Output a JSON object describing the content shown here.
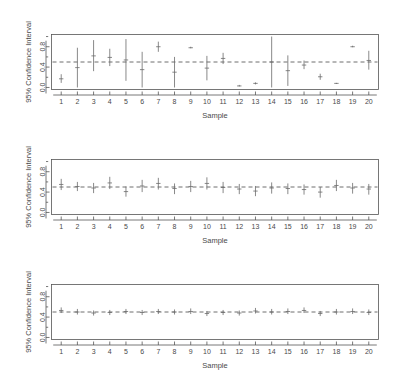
{
  "figure": {
    "background": "#ffffff",
    "foreground": "#4a4a4a",
    "interval_color": "#6b6b6b"
  },
  "chart_data": [
    {
      "type": "line",
      "panel_index": 1,
      "title": "",
      "xlabel": "Sample",
      "ylabel": "95% Confidence Interval",
      "xlim": [
        0.4,
        20.6
      ],
      "ylim": [
        -0.04,
        1.04
      ],
      "yticks": [
        0.0,
        0.4,
        0.8
      ],
      "ytick_labels": [
        "0.0",
        "0.4",
        "0.8"
      ],
      "xticks": [
        1,
        2,
        3,
        4,
        5,
        6,
        7,
        8,
        9,
        10,
        11,
        12,
        13,
        14,
        15,
        16,
        17,
        18,
        19,
        20
      ],
      "xtick_labels": [
        "1",
        "2",
        "3",
        "4",
        "5",
        "6",
        "7",
        "8",
        "9",
        "10",
        "11",
        "12",
        "13",
        "14",
        "15",
        "16",
        "17",
        "18",
        "19",
        "20"
      ],
      "grid": false,
      "reference_line": {
        "y": 0.5,
        "style": "dashed",
        "label": "true proportion"
      },
      "series": [
        {
          "name": "95% confidence intervals (small n)",
          "x": [
            1,
            2,
            3,
            4,
            5,
            6,
            7,
            8,
            9,
            10,
            11,
            12,
            13,
            14,
            15,
            16,
            17,
            18,
            19,
            20
          ],
          "lower": [
            0.09,
            0.0,
            0.32,
            0.42,
            0.13,
            0.0,
            0.7,
            0.0,
            0.77,
            0.14,
            0.46,
            0.02,
            0.06,
            0.0,
            0.03,
            0.36,
            0.15,
            0.07,
            0.79,
            0.35
          ],
          "upper": [
            0.26,
            0.78,
            0.93,
            0.76,
            0.95,
            0.7,
            0.9,
            0.6,
            0.8,
            0.62,
            0.68,
            0.05,
            0.1,
            1.0,
            0.63,
            0.53,
            0.27,
            0.09,
            0.82,
            0.72
          ],
          "center": [
            0.17,
            0.39,
            0.62,
            0.59,
            0.54,
            0.35,
            0.8,
            0.3,
            0.78,
            0.38,
            0.57,
            0.03,
            0.08,
            0.5,
            0.33,
            0.44,
            0.21,
            0.08,
            0.8,
            0.53
          ]
        }
      ]
    },
    {
      "type": "line",
      "panel_index": 2,
      "title": "",
      "xlabel": "Sample",
      "ylabel": "95% Confidence Interval",
      "xlim": [
        0.4,
        20.6
      ],
      "ylim": [
        -0.04,
        1.04
      ],
      "yticks": [
        0.0,
        0.4,
        0.8
      ],
      "ytick_labels": [
        "0.0",
        "0.4",
        "0.8"
      ],
      "xticks": [
        1,
        2,
        3,
        4,
        5,
        6,
        7,
        8,
        9,
        10,
        11,
        12,
        13,
        14,
        15,
        16,
        17,
        18,
        19,
        20
      ],
      "xtick_labels": [
        "1",
        "2",
        "3",
        "4",
        "5",
        "6",
        "7",
        "8",
        "9",
        "10",
        "11",
        "12",
        "13",
        "14",
        "15",
        "16",
        "17",
        "18",
        "19",
        "20"
      ],
      "grid": false,
      "reference_line": {
        "y": 0.5,
        "style": "dashed",
        "label": "true proportion"
      },
      "series": [
        {
          "name": "95% confidence intervals (medium n)",
          "x": [
            1,
            2,
            3,
            4,
            5,
            6,
            7,
            8,
            9,
            10,
            11,
            12,
            13,
            14,
            15,
            16,
            17,
            18,
            19,
            20
          ],
          "lower": [
            0.44,
            0.42,
            0.38,
            0.46,
            0.31,
            0.4,
            0.45,
            0.36,
            0.4,
            0.45,
            0.38,
            0.36,
            0.32,
            0.37,
            0.36,
            0.35,
            0.29,
            0.42,
            0.37,
            0.35
          ],
          "upper": [
            0.66,
            0.6,
            0.58,
            0.7,
            0.51,
            0.64,
            0.68,
            0.57,
            0.62,
            0.69,
            0.6,
            0.56,
            0.52,
            0.59,
            0.57,
            0.55,
            0.5,
            0.64,
            0.58,
            0.56
          ],
          "center": [
            0.55,
            0.51,
            0.48,
            0.58,
            0.41,
            0.52,
            0.57,
            0.47,
            0.51,
            0.57,
            0.49,
            0.46,
            0.42,
            0.48,
            0.47,
            0.45,
            0.4,
            0.53,
            0.48,
            0.46
          ]
        }
      ]
    },
    {
      "type": "line",
      "panel_index": 3,
      "title": "",
      "xlabel": "Sample",
      "ylabel": "95% Confidence Interval",
      "xlim": [
        0.4,
        20.6
      ],
      "ylim": [
        -0.04,
        1.04
      ],
      "yticks": [
        0.0,
        0.4,
        0.8
      ],
      "ytick_labels": [
        "0.0",
        "0.4",
        "0.8"
      ],
      "xticks": [
        1,
        2,
        3,
        4,
        5,
        6,
        7,
        8,
        9,
        10,
        11,
        12,
        13,
        14,
        15,
        16,
        17,
        18,
        19,
        20
      ],
      "xtick_labels": [
        "1",
        "2",
        "3",
        "4",
        "5",
        "6",
        "7",
        "8",
        "9",
        "10",
        "11",
        "12",
        "13",
        "14",
        "15",
        "16",
        "17",
        "18",
        "19",
        "20"
      ],
      "grid": false,
      "reference_line": {
        "y": 0.5,
        "style": "dashed",
        "label": "true proportion"
      },
      "series": [
        {
          "name": "95% confidence intervals (large n)",
          "x": [
            1,
            2,
            3,
            4,
            5,
            6,
            7,
            8,
            9,
            10,
            11,
            12,
            13,
            14,
            15,
            16,
            17,
            18,
            19,
            20
          ],
          "lower": [
            0.48,
            0.45,
            0.43,
            0.44,
            0.46,
            0.44,
            0.46,
            0.45,
            0.46,
            0.42,
            0.44,
            0.43,
            0.47,
            0.45,
            0.46,
            0.48,
            0.42,
            0.45,
            0.46,
            0.44
          ],
          "upper": [
            0.59,
            0.56,
            0.53,
            0.54,
            0.56,
            0.54,
            0.56,
            0.55,
            0.57,
            0.52,
            0.54,
            0.53,
            0.58,
            0.56,
            0.57,
            0.59,
            0.52,
            0.56,
            0.57,
            0.55
          ],
          "center": [
            0.53,
            0.5,
            0.48,
            0.49,
            0.51,
            0.49,
            0.51,
            0.5,
            0.51,
            0.47,
            0.49,
            0.48,
            0.52,
            0.5,
            0.51,
            0.53,
            0.47,
            0.5,
            0.51,
            0.49
          ]
        }
      ]
    }
  ]
}
